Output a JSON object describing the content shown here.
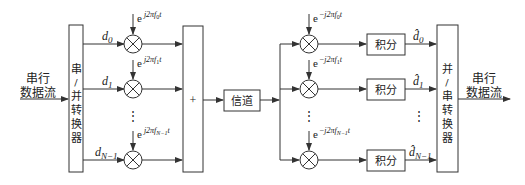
{
  "diagram": {
    "type": "OFDM modulation/demodulation block diagram",
    "input_label_line1": "串行",
    "input_label_line2": "数据流",
    "output_label_line1": "串行",
    "output_label_line2": "数据流",
    "sp_converter": {
      "chars": [
        "串",
        "/",
        "并",
        "转",
        "换",
        "器"
      ]
    },
    "ps_converter": {
      "chars": [
        "并",
        "/",
        "串",
        "转",
        "换",
        "器"
      ]
    },
    "sum_symbol": "+",
    "channel_label": "信道",
    "integrator_label": "积分",
    "tx_branches": [
      {
        "data": "d",
        "data_sub": "0",
        "osc_base": "e",
        "osc_exp": "j2πf",
        "osc_sub": "0",
        "osc_t": "t"
      },
      {
        "data": "d",
        "data_sub": "1",
        "osc_base": "e",
        "osc_exp": "j2πf",
        "osc_sub": "1",
        "osc_t": "t"
      },
      {
        "data": "d",
        "data_sub": "N−1",
        "osc_base": "e",
        "osc_exp": "j2πf",
        "osc_sub": "N−1",
        "osc_t": "t"
      }
    ],
    "rx_branches": [
      {
        "osc_base": "e",
        "osc_exp": "−j2πf",
        "osc_sub": "0",
        "osc_t": "t",
        "out": "d̂",
        "out_sub": "0"
      },
      {
        "osc_base": "e",
        "osc_exp": "−j2πf",
        "osc_sub": "1",
        "osc_t": "t",
        "out": "d̂",
        "out_sub": "1"
      },
      {
        "osc_base": "e",
        "osc_exp": "−j2πf",
        "osc_sub": "N−1",
        "osc_t": "t",
        "out": "d̂",
        "out_sub": "N−1"
      }
    ],
    "ellipsis": "⋮"
  }
}
